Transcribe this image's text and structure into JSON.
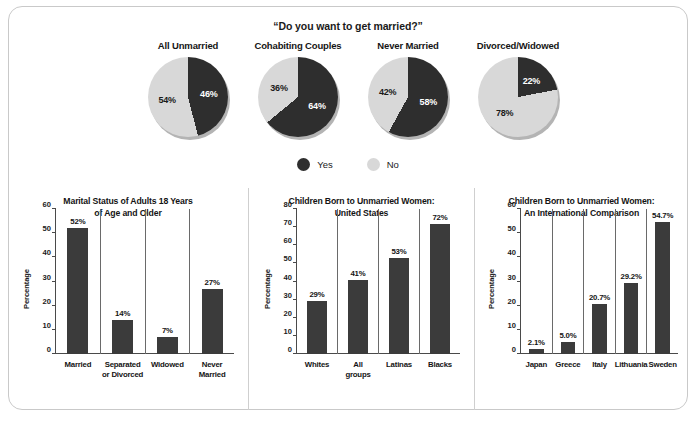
{
  "colors": {
    "yes_dark": "#2e2e2e",
    "no_light": "#d8d8d8",
    "bar_fill": "#3b3b3b",
    "axis": "#4a4a4a",
    "border": "#c9c9c9",
    "text": "#1a1a1a"
  },
  "pie_section": {
    "question": "“Do you want to get married?”",
    "legend": [
      {
        "label": "Yes",
        "color": "#2e2e2e",
        "icon": "filled-circle-icon"
      },
      {
        "label": "No",
        "color": "#d8d8d8",
        "icon": "filled-circle-icon"
      }
    ]
  },
  "chart_data": [
    {
      "type": "pie",
      "title": "All Unmarried",
      "labels": [
        "Yes",
        "No"
      ],
      "values": [
        46,
        54
      ],
      "value_labels": [
        "46%",
        "54%"
      ],
      "colors": [
        "#2e2e2e",
        "#d8d8d8"
      ],
      "legend_position": "bottom-center"
    },
    {
      "type": "pie",
      "title": "Cohabiting Couples",
      "labels": [
        "Yes",
        "No"
      ],
      "values": [
        64,
        36
      ],
      "value_labels": [
        "64%",
        "36%"
      ],
      "colors": [
        "#2e2e2e",
        "#d8d8d8"
      ],
      "legend_position": "bottom-center"
    },
    {
      "type": "pie",
      "title": "Never Married",
      "labels": [
        "Yes",
        "No"
      ],
      "values": [
        58,
        42
      ],
      "value_labels": [
        "58%",
        "42%"
      ],
      "colors": [
        "#2e2e2e",
        "#d8d8d8"
      ],
      "legend_position": "bottom-center"
    },
    {
      "type": "pie",
      "title": "Divorced/Widowed",
      "labels": [
        "Yes",
        "No"
      ],
      "values": [
        22,
        78
      ],
      "value_labels": [
        "22%",
        "78%"
      ],
      "colors": [
        "#2e2e2e",
        "#d8d8d8"
      ],
      "legend_position": "bottom-center"
    },
    {
      "type": "bar",
      "title": "Marital Status of Adults 18 Years of Age and Older",
      "title_lines": [
        "Marital Status of Adults 18 Years",
        "of Age and Older"
      ],
      "xlabel": "",
      "ylabel": "Percentage",
      "ylim": [
        0,
        60
      ],
      "yticks": [
        0,
        10,
        20,
        30,
        40,
        50,
        60
      ],
      "grid": false,
      "categories": [
        "Married",
        "Separated or Divorced",
        "Widowed",
        "Never Married"
      ],
      "category_lines": [
        [
          "Married"
        ],
        [
          "Separated",
          "or Divorced"
        ],
        [
          "Widowed"
        ],
        [
          "Never",
          "Married"
        ]
      ],
      "values": [
        52,
        14,
        7,
        27
      ],
      "value_labels": [
        "52%",
        "14%",
        "7%",
        "27%"
      ]
    },
    {
      "type": "bar",
      "title": "Children Born to Unmarried Women: United States",
      "title_lines": [
        "Children Born to Unmarried Women:",
        "United States"
      ],
      "xlabel": "",
      "ylabel": "Percentage",
      "ylim": [
        0,
        80
      ],
      "yticks": [
        0,
        10,
        20,
        30,
        40,
        50,
        60,
        70,
        80
      ],
      "grid": false,
      "categories": [
        "Whites",
        "All groups",
        "Latinas",
        "Blacks"
      ],
      "category_lines": [
        [
          "Whites"
        ],
        [
          "All",
          "groups"
        ],
        [
          "Latinas"
        ],
        [
          "Blacks"
        ]
      ],
      "values": [
        29,
        41,
        53,
        72
      ],
      "value_labels": [
        "29%",
        "41%",
        "53%",
        "72%"
      ]
    },
    {
      "type": "bar",
      "title": "Children Born to Unmarried Women: An International Comparison",
      "title_lines": [
        "Children Born to Unmarried Women:",
        "An International Comparison"
      ],
      "xlabel": "",
      "ylabel": "Percentage",
      "ylim": [
        0,
        60
      ],
      "yticks": [
        0,
        10,
        20,
        30,
        40,
        50,
        60
      ],
      "grid": false,
      "categories": [
        "Japan",
        "Greece",
        "Italy",
        "Lithuania",
        "Sweden"
      ],
      "category_lines": [
        [
          "Japan"
        ],
        [
          "Greece"
        ],
        [
          "Italy"
        ],
        [
          "Lithuania"
        ],
        [
          "Sweden"
        ]
      ],
      "values": [
        2.1,
        5.0,
        20.7,
        29.2,
        54.7
      ],
      "value_labels": [
        "2.1%",
        "5.0%",
        "20.7%",
        "29.2%",
        "54.7%"
      ]
    }
  ]
}
